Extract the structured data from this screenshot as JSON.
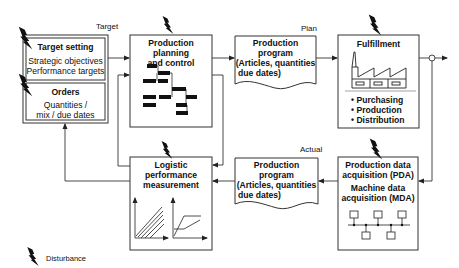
{
  "labels": {
    "target": "Target",
    "plan": "Plan",
    "actual": "Actual",
    "disturbance": "Disturbance"
  },
  "target_setting": {
    "title": "Target setting",
    "line1": "Strategic objectives",
    "line2": "Performance targets"
  },
  "orders": {
    "title": "Orders",
    "line1": "Quantities /",
    "line2": "mix / due dates"
  },
  "planning": {
    "line1": "Production planning",
    "line2": "and control"
  },
  "plan_program": {
    "line1": "Production",
    "line2": "program",
    "line3": "(Articles, quantities",
    "line4": "due dates)"
  },
  "fulfillment": {
    "title": "Fulfillment",
    "items": [
      "• Purchasing",
      "• Production",
      "• Distribution"
    ]
  },
  "actual_program": {
    "line1": "Production",
    "line2": "program",
    "line3": "(Articles, quantities",
    "line4": "due dates)"
  },
  "logistic": {
    "line1": "Logistic",
    "line2": "performance",
    "line3": "measurement"
  },
  "pda": {
    "line1": "Production data",
    "line2": "acquisition (PDA)",
    "line3": "Machine data",
    "line4": "acquisition (MDA)"
  },
  "icons": {
    "disturbance": "lightning-bolt-icon",
    "factory": "factory-icon",
    "network": "network-icon",
    "gantt": "gantt-chart-icon",
    "throughput": "throughput-diagram-icon",
    "operating_curve": "operating-curve-icon"
  }
}
